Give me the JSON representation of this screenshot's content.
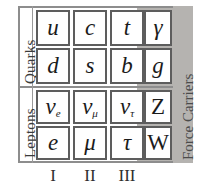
{
  "figure": {
    "background_color": "#ffffff",
    "frame_color": "#8d8d8d",
    "cell_border_color": "#5d5d5d",
    "force_panel_color": "#b5b3b0"
  },
  "row_groups": [
    {
      "key": "quarks",
      "label": "Quarks"
    },
    {
      "key": "leptons",
      "label": "Leptons"
    }
  ],
  "column_group": {
    "label": "Force Carriers"
  },
  "generations": [
    {
      "numeral": "I"
    },
    {
      "numeral": "II"
    },
    {
      "numeral": "III"
    }
  ],
  "matter_rows": [
    {
      "group": "quarks",
      "cells": [
        {
          "symbol": "u",
          "sub": "",
          "style": "italic"
        },
        {
          "symbol": "c",
          "sub": "",
          "style": "italic"
        },
        {
          "symbol": "t",
          "sub": "",
          "style": "italic"
        }
      ]
    },
    {
      "group": "quarks",
      "cells": [
        {
          "symbol": "d",
          "sub": "",
          "style": "italic"
        },
        {
          "symbol": "s",
          "sub": "",
          "style": "italic"
        },
        {
          "symbol": "b",
          "sub": "",
          "style": "italic"
        }
      ]
    },
    {
      "group": "leptons",
      "cells": [
        {
          "symbol": "ν",
          "sub": "e",
          "style": "italic"
        },
        {
          "symbol": "ν",
          "sub": "μ",
          "style": "italic"
        },
        {
          "symbol": "ν",
          "sub": "τ",
          "style": "italic"
        }
      ]
    },
    {
      "group": "leptons",
      "cells": [
        {
          "symbol": "e",
          "sub": "",
          "style": "italic"
        },
        {
          "symbol": "μ",
          "sub": "",
          "style": "italic"
        },
        {
          "symbol": "τ",
          "sub": "",
          "style": "italic"
        }
      ]
    }
  ],
  "force_carriers": [
    {
      "symbol": "γ",
      "style": "italic"
    },
    {
      "symbol": "g",
      "style": "italic"
    },
    {
      "symbol": "Z",
      "style": "upright"
    },
    {
      "symbol": "W",
      "style": "upright"
    }
  ]
}
